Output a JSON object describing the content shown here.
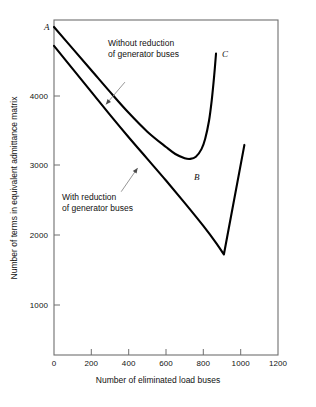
{
  "chart_data": {
    "type": "line",
    "title": "",
    "xlabel": "Number of eliminated load buses",
    "ylabel": "Number of terms in equivalent admittance matrix",
    "xlim": [
      0,
      1200
    ],
    "ylim": [
      0,
      4800
    ],
    "xticks": [
      0,
      200,
      400,
      600,
      800,
      1000,
      1200
    ],
    "xtick_labels": [
      "0",
      "200",
      "400",
      "600",
      "800",
      "1000",
      "1200"
    ],
    "yticks": [
      1000,
      2000,
      3000,
      4000
    ],
    "ytick_labels": [
      "1000",
      "2000",
      "3000",
      "4000"
    ],
    "grid": false,
    "legend_position": "none",
    "frame": "box",
    "series": [
      {
        "name": "Without reduction of generator buses",
        "color": "#000000",
        "points": [
          {
            "x": 0,
            "y": 4700
          },
          {
            "x": 100,
            "y": 4390
          },
          {
            "x": 200,
            "y": 4080
          },
          {
            "x": 300,
            "y": 3770
          },
          {
            "x": 400,
            "y": 3470
          },
          {
            "x": 500,
            "y": 3200
          },
          {
            "x": 600,
            "y": 2980
          },
          {
            "x": 650,
            "y": 2880
          },
          {
            "x": 700,
            "y": 2820
          },
          {
            "x": 730,
            "y": 2810
          },
          {
            "x": 760,
            "y": 2840
          },
          {
            "x": 790,
            "y": 2950
          },
          {
            "x": 810,
            "y": 3100
          },
          {
            "x": 830,
            "y": 3350
          },
          {
            "x": 845,
            "y": 3650
          },
          {
            "x": 858,
            "y": 4000
          },
          {
            "x": 868,
            "y": 4320
          }
        ]
      },
      {
        "name": "With reduction of generator buses",
        "color": "#000000",
        "points": [
          {
            "x": 0,
            "y": 4430
          },
          {
            "x": 100,
            "y": 4100
          },
          {
            "x": 200,
            "y": 3770
          },
          {
            "x": 300,
            "y": 3440
          },
          {
            "x": 400,
            "y": 3120
          },
          {
            "x": 500,
            "y": 2810
          },
          {
            "x": 600,
            "y": 2500
          },
          {
            "x": 700,
            "y": 2180
          },
          {
            "x": 800,
            "y": 1850
          },
          {
            "x": 870,
            "y": 1600
          },
          {
            "x": 910,
            "y": 1440
          },
          {
            "x": 1020,
            "y": 3010
          }
        ]
      }
    ],
    "annotations": [
      {
        "name": "without-reduction-annotation",
        "lines": [
          "Without reduction",
          "of generator buses"
        ],
        "arrow_from": {
          "x": 380,
          "y": 3910
        },
        "arrow_to": {
          "x": 278,
          "y": 3590
        }
      },
      {
        "name": "with-reduction-annotation",
        "lines": [
          "With reduction",
          "of generator buses"
        ],
        "arrow_from": {
          "x": 360,
          "y": 2340
        },
        "arrow_to": {
          "x": 448,
          "y": 2680
        }
      }
    ],
    "point_labels": [
      {
        "name": "point-A",
        "label": "A",
        "x": 0,
        "y": 4700
      },
      {
        "name": "point-B",
        "label": "B",
        "x": 735,
        "y": 2810
      },
      {
        "name": "point-C",
        "label": "C",
        "x": 868,
        "y": 4320
      }
    ]
  },
  "axes": {
    "x_title": "Number of eliminated load buses",
    "y_title": "Number of terms in equivalent admittance matrix",
    "x_tick_labels": [
      "0",
      "200",
      "400",
      "600",
      "800",
      "1000",
      "1200"
    ],
    "y_tick_labels": [
      "1000",
      "2000",
      "3000",
      "4000"
    ]
  },
  "annotations": {
    "without_line1": "Without reduction",
    "without_line2": "of generator buses",
    "with_line1": "With reduction",
    "with_line2": "of generator buses"
  },
  "points": {
    "a": "A",
    "b": "B",
    "c": "C"
  },
  "colors": {
    "curve": "#000000",
    "frame": "#7a7a7a",
    "leader": "#8a8a8a",
    "background": "#ffffff"
  }
}
